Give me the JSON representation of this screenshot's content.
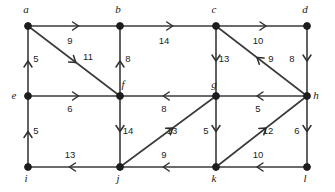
{
  "diagram": {
    "type": "directed-weighted-graph",
    "colors": {
      "background": "#ffffff",
      "edge": "#3a3a3a",
      "node": "#1d1d1d",
      "label": "#1a1a1a",
      "weight": "#222222"
    },
    "nodes": [
      {
        "id": "a",
        "label": "a",
        "x": 28,
        "y": 26,
        "label_x": 26,
        "label_y": 13
      },
      {
        "id": "b",
        "label": "b",
        "x": 120,
        "y": 26,
        "label_x": 118,
        "label_y": 13
      },
      {
        "id": "c",
        "label": "c",
        "x": 216,
        "y": 26,
        "label_x": 214,
        "label_y": 13
      },
      {
        "id": "d",
        "label": "d",
        "x": 307,
        "y": 26,
        "label_x": 305,
        "label_y": 13
      },
      {
        "id": "e",
        "label": "e",
        "x": 28,
        "y": 96,
        "label_x": 14,
        "label_y": 99
      },
      {
        "id": "f",
        "label": "f",
        "x": 120,
        "y": 96,
        "label_x": 123,
        "label_y": 88
      },
      {
        "id": "g",
        "label": "g",
        "x": 216,
        "y": 96,
        "label_x": 214,
        "label_y": 88
      },
      {
        "id": "h",
        "label": "h",
        "x": 307,
        "y": 96,
        "label_x": 316,
        "label_y": 99
      },
      {
        "id": "i",
        "label": "i",
        "x": 28,
        "y": 167,
        "label_x": 26,
        "label_y": 182
      },
      {
        "id": "j",
        "label": "j",
        "x": 120,
        "y": 167,
        "label_x": 118,
        "label_y": 182
      },
      {
        "id": "k",
        "label": "k",
        "x": 216,
        "y": 167,
        "label_x": 214,
        "label_y": 182
      },
      {
        "id": "l",
        "label": "l",
        "x": 307,
        "y": 167,
        "label_x": 305,
        "label_y": 182
      }
    ],
    "edges": [
      {
        "id": "a-b",
        "from": "a",
        "to": "b",
        "weight": "9",
        "weight_x": 70,
        "weight_y": 44,
        "arrow_t": 0.55,
        "direction": "right"
      },
      {
        "id": "b-c",
        "from": "b",
        "to": "c",
        "weight": "14",
        "weight_x": 164,
        "weight_y": 44,
        "arrow_t": 0.55,
        "direction": "right"
      },
      {
        "id": "c-d",
        "from": "c",
        "to": "d",
        "weight": "10",
        "weight_x": 258,
        "weight_y": 44,
        "arrow_t": 0.55,
        "direction": "right"
      },
      {
        "id": "e-a",
        "from": "e",
        "to": "a",
        "weight": "5",
        "weight_x": 36,
        "weight_y": 62,
        "arrow_t": 0.5,
        "direction": "up"
      },
      {
        "id": "f-b",
        "from": "f",
        "to": "b",
        "weight": "8",
        "weight_x": 128,
        "weight_y": 62,
        "arrow_t": 0.5,
        "direction": "up"
      },
      {
        "id": "c-g",
        "from": "c",
        "to": "g",
        "weight": "13",
        "weight_x": 224,
        "weight_y": 62,
        "arrow_t": 0.5,
        "direction": "down"
      },
      {
        "id": "d-h",
        "from": "d",
        "to": "h",
        "weight": "8",
        "weight_x": 292,
        "weight_y": 62,
        "arrow_t": 0.5,
        "direction": "down"
      },
      {
        "id": "a-f",
        "from": "a",
        "to": "f",
        "weight": "11",
        "weight_x": 88,
        "weight_y": 60,
        "arrow_t": 0.52,
        "direction": "down-right"
      },
      {
        "id": "h-c",
        "from": "h",
        "to": "c",
        "weight": "9",
        "weight_x": 271,
        "weight_y": 62,
        "arrow_t": 0.55,
        "direction": "up-left"
      },
      {
        "id": "e-f",
        "from": "e",
        "to": "f",
        "weight": "6",
        "weight_x": 70,
        "weight_y": 112,
        "arrow_t": 0.55,
        "direction": "right"
      },
      {
        "id": "g-f",
        "from": "g",
        "to": "f",
        "weight": "8",
        "weight_x": 164,
        "weight_y": 112,
        "arrow_t": 0.55,
        "direction": "left"
      },
      {
        "id": "h-g",
        "from": "h",
        "to": "g",
        "weight": "5",
        "weight_x": 258,
        "weight_y": 112,
        "arrow_t": 0.55,
        "direction": "left"
      },
      {
        "id": "i-e",
        "from": "i",
        "to": "e",
        "weight": "5",
        "weight_x": 36,
        "weight_y": 134,
        "arrow_t": 0.5,
        "direction": "up"
      },
      {
        "id": "f-j",
        "from": "f",
        "to": "j",
        "weight": "14",
        "weight_x": 128,
        "weight_y": 134,
        "arrow_t": 0.5,
        "direction": "down"
      },
      {
        "id": "g-k",
        "from": "g",
        "to": "k",
        "weight": "5",
        "weight_x": 206,
        "weight_y": 134,
        "arrow_t": 0.5,
        "direction": "down"
      },
      {
        "id": "h-l",
        "from": "h",
        "to": "l",
        "weight": "6",
        "weight_x": 297,
        "weight_y": 134,
        "arrow_t": 0.5,
        "direction": "down"
      },
      {
        "id": "j-g",
        "from": "j",
        "to": "g",
        "weight": "13",
        "weight_x": 172,
        "weight_y": 134,
        "arrow_t": 0.55,
        "direction": "up-right"
      },
      {
        "id": "k-h",
        "from": "k",
        "to": "h",
        "weight": "12",
        "weight_x": 268,
        "weight_y": 134,
        "arrow_t": 0.55,
        "direction": "up-right"
      },
      {
        "id": "j-i",
        "from": "j",
        "to": "i",
        "weight": "13",
        "weight_x": 70,
        "weight_y": 158,
        "arrow_t": 0.55,
        "direction": "left"
      },
      {
        "id": "k-j",
        "from": "k",
        "to": "j",
        "weight": "9",
        "weight_x": 164,
        "weight_y": 158,
        "arrow_t": 0.55,
        "direction": "left"
      },
      {
        "id": "l-k",
        "from": "l",
        "to": "k",
        "weight": "10",
        "weight_x": 258,
        "weight_y": 158,
        "arrow_t": 0.55,
        "direction": "left"
      }
    ]
  }
}
